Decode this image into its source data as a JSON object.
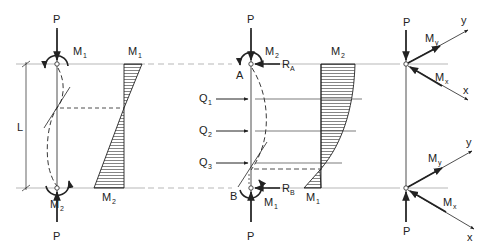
{
  "figure": {
    "colors": {
      "line": "#222222",
      "guide": "#999999",
      "hatch": "#333333",
      "background": "#ffffff"
    }
  },
  "panel_a": {
    "top_load": "P",
    "bottom_load": "P",
    "top_moment": {
      "main": "M",
      "sub": "1"
    },
    "bottom_moment": {
      "main": "M",
      "sub": "2"
    },
    "length_label": "L",
    "diagram_top_label": {
      "main": "M",
      "sub": "1"
    },
    "diagram_bottom_label": {
      "main": "M",
      "sub": "2"
    }
  },
  "panel_b": {
    "top_load": "P",
    "bottom_load": "P",
    "top_support": "A",
    "bottom_support": "B",
    "top_moment": {
      "main": "M",
      "sub": "2"
    },
    "bottom_moment": {
      "main": "M",
      "sub": "1"
    },
    "top_reaction": {
      "main": "R",
      "sub": "A"
    },
    "bottom_reaction": {
      "main": "R",
      "sub": "B"
    },
    "lateral_loads": [
      {
        "main": "Q",
        "sub": "1"
      },
      {
        "main": "Q",
        "sub": "2"
      },
      {
        "main": "Q",
        "sub": "3"
      }
    ],
    "diagram_top_label": {
      "main": "M",
      "sub": "2"
    },
    "diagram_bottom_label": {
      "main": "M",
      "sub": "1"
    }
  },
  "panel_c": {
    "top_load": "P",
    "bottom_load": "P",
    "top": {
      "my": {
        "main": "M",
        "sub": "y"
      },
      "mx": {
        "main": "M",
        "sub": "x"
      },
      "axis_y": "y",
      "axis_x": "x"
    },
    "bottom": {
      "my": {
        "main": "M",
        "sub": "y"
      },
      "mx": {
        "main": "M",
        "sub": "x"
      },
      "axis_y": "y",
      "axis_x": "x"
    }
  }
}
